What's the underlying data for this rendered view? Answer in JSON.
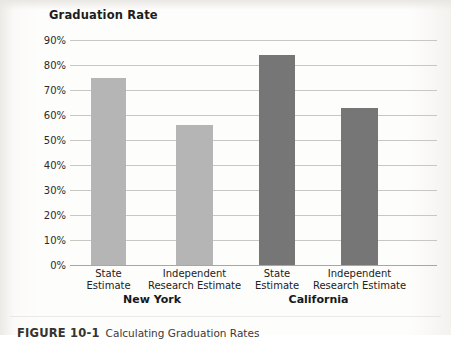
{
  "figure": {
    "caption_number": "FIGURE 10-1",
    "caption_text": "Calculating Graduation Rates"
  },
  "colors": {
    "new_york_bar": "#b5b5b5",
    "california_bar": "#767676",
    "gridline": "#c9c7c4",
    "axis": "#a9a7a4",
    "text": "#222220"
  },
  "chart_data": {
    "type": "bar",
    "title": "Graduation Rate",
    "xlabel": "",
    "ylabel": "",
    "ylim": [
      0,
      90
    ],
    "grid": true,
    "legend": "none",
    "ytick_labels": [
      "90%",
      "80%",
      "70%",
      "60%",
      "50%",
      "40%",
      "30%",
      "20%",
      "10%",
      "0%"
    ],
    "ytick_values": [
      90,
      80,
      70,
      60,
      50,
      40,
      30,
      20,
      10,
      0
    ],
    "categories": [
      "State\nEstimate",
      "Independent\nResearch Estimate",
      "State\nEstimate",
      "Independent\nResearch Estimate"
    ],
    "bars": [
      {
        "label_line1": "State",
        "label_line2": "Estimate",
        "group": "New York",
        "value": 75,
        "color": "#b5b5b5"
      },
      {
        "label_line1": "Independent",
        "label_line2": "Research Estimate",
        "group": "New York",
        "value": 56,
        "color": "#b5b5b5"
      },
      {
        "label_line1": "State",
        "label_line2": "Estimate",
        "group": "California",
        "value": 84,
        "color": "#767676"
      },
      {
        "label_line1": "Independent",
        "label_line2": "Research Estimate",
        "group": "California",
        "value": 63,
        "color": "#767676"
      }
    ],
    "groups": [
      {
        "name": "New York",
        "bar_indices": [
          0,
          1
        ]
      },
      {
        "name": "California",
        "bar_indices": [
          2,
          3
        ]
      }
    ],
    "values": [
      75,
      56,
      84,
      63
    ]
  }
}
